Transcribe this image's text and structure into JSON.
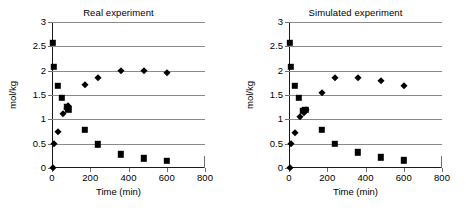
{
  "figure": {
    "panels": [
      {
        "id": "real",
        "title": "Real experiment"
      },
      {
        "id": "simulated",
        "title": "Simulated experiment"
      }
    ],
    "axis": {
      "xlabel": "Time (min)",
      "ylabel": "mol/kg",
      "xticks": [
        "0",
        "200",
        "400",
        "600",
        "800"
      ],
      "yticks": [
        "0",
        "0.5",
        "1",
        "1.5",
        "2",
        "2.5",
        "3"
      ]
    },
    "colors": {
      "marker": "#000000",
      "gridline": "#8a8a8a",
      "axis": "#1a1a1a",
      "background": "#ffffff"
    }
  },
  "chart_data": [
    {
      "type": "scatter",
      "title": "Real experiment",
      "xlabel": "Time (min)",
      "ylabel": "mol/kg",
      "xlim": [
        0,
        800
      ],
      "ylim": [
        0,
        3
      ],
      "xticks": [
        0,
        200,
        400,
        600,
        800
      ],
      "yticks": [
        0,
        0.5,
        1,
        1.5,
        2,
        2.5,
        3
      ],
      "grid": "horizontal",
      "legend": "none",
      "series": [
        {
          "name": "square-series",
          "marker": "square",
          "points": [
            {
              "x": 3,
              "y": 2.57
            },
            {
              "x": 8,
              "y": 2.08
            },
            {
              "x": 30,
              "y": 1.69
            },
            {
              "x": 52,
              "y": 1.44
            },
            {
              "x": 78,
              "y": 1.26
            },
            {
              "x": 86,
              "y": 1.21
            },
            {
              "x": 172,
              "y": 0.79
            },
            {
              "x": 240,
              "y": 0.49
            },
            {
              "x": 360,
              "y": 0.28
            },
            {
              "x": 480,
              "y": 0.2
            },
            {
              "x": 600,
              "y": 0.15
            }
          ]
        },
        {
          "name": "diamond-series",
          "marker": "diamond",
          "points": [
            {
              "x": 3,
              "y": 0.0
            },
            {
              "x": 10,
              "y": 0.5
            },
            {
              "x": 30,
              "y": 0.75
            },
            {
              "x": 56,
              "y": 1.1
            },
            {
              "x": 80,
              "y": 1.22
            },
            {
              "x": 86,
              "y": 1.27
            },
            {
              "x": 172,
              "y": 1.7
            },
            {
              "x": 240,
              "y": 1.85
            },
            {
              "x": 360,
              "y": 2.0
            },
            {
              "x": 480,
              "y": 2.0
            },
            {
              "x": 600,
              "y": 1.95
            }
          ]
        }
      ]
    },
    {
      "type": "scatter",
      "title": "Simulated experiment",
      "xlabel": "Time (min)",
      "ylabel": "mol/kg",
      "xlim": [
        0,
        800
      ],
      "ylim": [
        0,
        3
      ],
      "xticks": [
        0,
        200,
        400,
        600,
        800
      ],
      "yticks": [
        0,
        0.5,
        1,
        1.5,
        2,
        2.5,
        3
      ],
      "grid": "horizontal",
      "legend": "none",
      "series": [
        {
          "name": "square-series",
          "marker": "square",
          "points": [
            {
              "x": 3,
              "y": 2.57
            },
            {
              "x": 8,
              "y": 2.08
            },
            {
              "x": 30,
              "y": 1.69
            },
            {
              "x": 52,
              "y": 1.44
            },
            {
              "x": 72,
              "y": 1.18
            },
            {
              "x": 86,
              "y": 1.19
            },
            {
              "x": 172,
              "y": 0.79
            },
            {
              "x": 240,
              "y": 0.5
            },
            {
              "x": 360,
              "y": 0.32
            },
            {
              "x": 480,
              "y": 0.22
            },
            {
              "x": 600,
              "y": 0.16
            }
          ]
        },
        {
          "name": "diamond-series",
          "marker": "diamond",
          "points": [
            {
              "x": 3,
              "y": 0.0
            },
            {
              "x": 10,
              "y": 0.5
            },
            {
              "x": 30,
              "y": 0.71
            },
            {
              "x": 56,
              "y": 1.05
            },
            {
              "x": 80,
              "y": 1.13
            },
            {
              "x": 90,
              "y": 1.19
            },
            {
              "x": 172,
              "y": 1.55
            },
            {
              "x": 240,
              "y": 1.85
            },
            {
              "x": 360,
              "y": 1.85
            },
            {
              "x": 480,
              "y": 1.79
            },
            {
              "x": 600,
              "y": 1.69
            }
          ]
        }
      ]
    }
  ]
}
